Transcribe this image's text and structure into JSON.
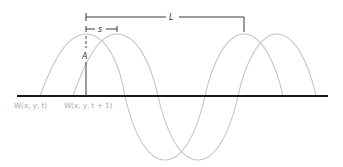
{
  "diagram": {
    "labels": {
      "wavelength": "L",
      "shift": "s",
      "amplitude": "A",
      "wave_t": "W(x, y, t)",
      "wave_t1": "W(x, y, t + 1)"
    },
    "colors": {
      "wave": "#c4c4c4",
      "baseline": "#1a1a1a",
      "dimension_lines": "#3a3a3a",
      "caption_text": "#a8a8a8"
    }
  }
}
